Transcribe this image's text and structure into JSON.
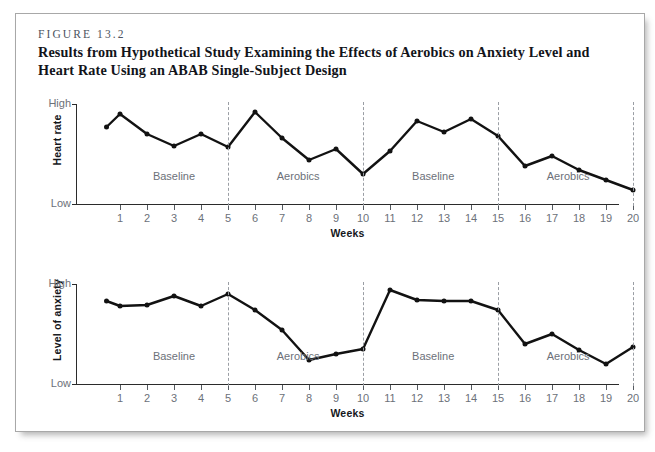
{
  "figure": {
    "number": "FIGURE 13.2",
    "title": "Results from Hypothetical Study Examining the Effects of Aerobics on Anxiety Level and Heart Rate Using an ABAB Single-Subject Design"
  },
  "axis_common": {
    "xlabel": "Weeks",
    "y_high": "High",
    "y_low": "Low",
    "xticks": [
      1,
      2,
      3,
      4,
      5,
      6,
      7,
      8,
      9,
      10,
      11,
      12,
      13,
      14,
      15,
      16,
      17,
      18,
      19,
      20
    ],
    "phase_dividers": [
      5,
      10,
      15,
      20
    ],
    "phases": [
      {
        "label": "Baseline",
        "center": 3
      },
      {
        "label": "Aerobics",
        "center": 7.6
      },
      {
        "label": "Baseline",
        "center": 12.6
      },
      {
        "label": "Aerobics",
        "center": 17.6
      }
    ],
    "line_color": "#121212",
    "axis_color": "#2b2b2b",
    "tick_label_color": "#6c7179",
    "divider_color": "#9a9ea4"
  },
  "chart_data": [
    {
      "type": "line",
      "title": "Heart rate",
      "ylabel": "Heart rate",
      "xlabel": "Weeks",
      "ylim": [
        0,
        1
      ],
      "ytick_labels": [
        "Low",
        "High"
      ],
      "grid": false,
      "legend": "none",
      "x": [
        0.5,
        1,
        2,
        3,
        4,
        5,
        6,
        7,
        8,
        9,
        10,
        11,
        12,
        13,
        14,
        15,
        16,
        17,
        18,
        19,
        20
      ],
      "values": [
        0.77,
        0.9,
        0.7,
        0.58,
        0.7,
        0.57,
        0.92,
        0.66,
        0.44,
        0.55,
        0.3,
        0.53,
        0.83,
        0.72,
        0.85,
        0.68,
        0.38,
        0.48,
        0.34,
        0.24,
        0.14
      ],
      "annotations": [
        "Baseline",
        "Aerobics",
        "Baseline",
        "Aerobics"
      ]
    },
    {
      "type": "line",
      "title": "Level of anxiety",
      "ylabel": "Level of anxiety",
      "xlabel": "Weeks",
      "ylim": [
        0,
        1
      ],
      "ytick_labels": [
        "Low",
        "High"
      ],
      "grid": false,
      "legend": "none",
      "x": [
        0.5,
        1,
        2,
        3,
        4,
        5,
        6,
        7,
        8,
        9,
        10,
        11,
        12,
        13,
        14,
        15,
        16,
        17,
        18,
        19,
        20
      ],
      "values": [
        0.83,
        0.78,
        0.79,
        0.88,
        0.78,
        0.9,
        0.74,
        0.54,
        0.24,
        0.3,
        0.35,
        0.94,
        0.84,
        0.83,
        0.83,
        0.74,
        0.4,
        0.5,
        0.34,
        0.2,
        0.37
      ],
      "annotations": [
        "Baseline",
        "Aerobics",
        "Baseline",
        "Aerobics"
      ]
    }
  ]
}
